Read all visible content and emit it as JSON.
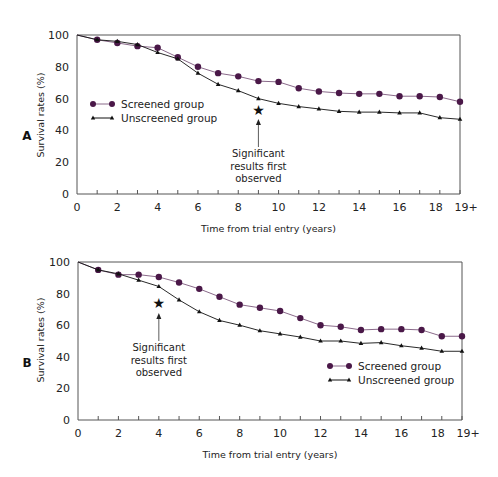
{
  "colors": {
    "screened": "#4a1848",
    "screened_line": "#8a6a8a",
    "unscreened": "#111111",
    "axis": "#555555"
  },
  "chart_data": [
    {
      "panel": "A",
      "type": "line",
      "title": "",
      "xlabel": "Time from trial entry (years)",
      "ylabel": "Survival rates (%)",
      "xlim": [
        0,
        19
      ],
      "ylim": [
        0,
        100
      ],
      "grid": false,
      "legend_position": "middle-left",
      "x_tick_labels": [
        "0",
        "2",
        "4",
        "6",
        "8",
        "10",
        "12",
        "14",
        "16",
        "18",
        "19+"
      ],
      "y_tick_labels": [
        "0",
        "20",
        "40",
        "60",
        "80",
        "100"
      ],
      "x": [
        0,
        1,
        2,
        3,
        4,
        5,
        6,
        7,
        8,
        9,
        10,
        11,
        12,
        13,
        14,
        15,
        16,
        17,
        18,
        19
      ],
      "series": [
        {
          "name": "Screened group",
          "marker": "circle",
          "values": [
            100,
            97,
            95,
            93,
            92,
            86,
            80,
            76,
            74,
            71,
            70.5,
            66.5,
            64.5,
            63.5,
            63,
            63,
            61.5,
            61.5,
            61,
            58
          ]
        },
        {
          "name": "Unscreened group",
          "marker": "triangle",
          "values": [
            100,
            97,
            96,
            94,
            89,
            85,
            76,
            69,
            65,
            60,
            57,
            55,
            53.5,
            52,
            51.5,
            51.5,
            51,
            51,
            48,
            47
          ]
        }
      ],
      "annotation": {
        "x": 9,
        "y": 53,
        "symbol": "★",
        "lines": [
          "Significant",
          "results first",
          "observed"
        ]
      }
    },
    {
      "panel": "B",
      "type": "line",
      "title": "",
      "xlabel": "Time from trial entry (years)",
      "ylabel": "Survival rates (%)",
      "xlim": [
        0,
        19
      ],
      "ylim": [
        0,
        100
      ],
      "grid": false,
      "legend_position": "lower-right",
      "x_tick_labels": [
        "0",
        "2",
        "4",
        "6",
        "8",
        "10",
        "12",
        "14",
        "16",
        "18",
        "19+"
      ],
      "y_tick_labels": [
        "0",
        "20",
        "40",
        "60",
        "80",
        "100"
      ],
      "x": [
        0,
        1,
        2,
        3,
        4,
        5,
        6,
        7,
        8,
        9,
        10,
        11,
        12,
        13,
        14,
        15,
        16,
        17,
        18,
        19
      ],
      "series": [
        {
          "name": "Screened group",
          "marker": "circle",
          "values": [
            100,
            95,
            92,
            92,
            90.5,
            87,
            83,
            78,
            73,
            71,
            69,
            64.5,
            60,
            59,
            57,
            57.5,
            57.5,
            57,
            53,
            53
          ]
        },
        {
          "name": "Unscreened group",
          "marker": "triangle",
          "values": [
            100,
            95,
            92.5,
            88.5,
            84.5,
            76,
            68.5,
            63,
            60,
            56.5,
            54.5,
            52.5,
            50,
            50,
            48.5,
            49,
            47,
            45.5,
            43.5,
            43.5
          ]
        }
      ],
      "annotation": {
        "x": 4,
        "y": 74,
        "symbol": "★",
        "lines": [
          "Significant",
          "results first",
          "observed"
        ]
      }
    }
  ]
}
